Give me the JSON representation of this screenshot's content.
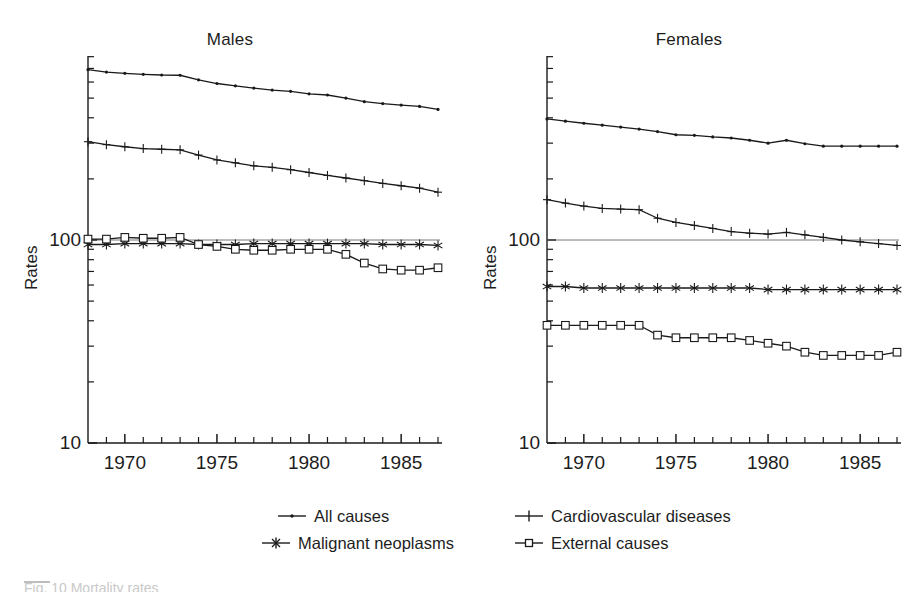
{
  "figure": {
    "caption_partial": "Fig. 10  Mortality rates",
    "background": "#ffffff",
    "line_color": "#1a1a1a"
  },
  "panels": [
    {
      "id": "males",
      "title": "Males",
      "ylabel": "Rates"
    },
    {
      "id": "females",
      "title": "Females",
      "ylabel": "Rates"
    }
  ],
  "legend": {
    "position": "bottom-center",
    "items": [
      {
        "label": "All causes",
        "marker": "dot",
        "color": "#1a1a1a"
      },
      {
        "label": "Cardiovascular diseases",
        "marker": "plus",
        "color": "#1a1a1a"
      },
      {
        "label": "Malignant neoplasms",
        "marker": "asterisk",
        "color": "#1a1a1a"
      },
      {
        "label": "External causes",
        "marker": "square",
        "color": "#1a1a1a"
      }
    ]
  },
  "axes": {
    "y_tick_labels": [
      "100",
      "10"
    ],
    "y_scale": "log",
    "ylim": [
      10,
      1000
    ],
    "x_tick_labels": [
      "1970",
      "1975",
      "1980",
      "1985"
    ],
    "x_tick_values": [
      1970,
      1975,
      1980,
      1985
    ],
    "xlim": [
      1968,
      1987
    ],
    "grid": false
  },
  "chart_data": {
    "type": "line",
    "xlabel": "",
    "ylabel": "Rates",
    "ylim": [
      10,
      1000
    ],
    "xlim": [
      1968,
      1987
    ],
    "yscale": "log",
    "grid": false,
    "legend_position": "bottom-center",
    "x": [
      1968,
      1969,
      1970,
      1971,
      1972,
      1973,
      1974,
      1975,
      1976,
      1977,
      1978,
      1979,
      1980,
      1981,
      1982,
      1983,
      1984,
      1985,
      1986,
      1987
    ],
    "panels": [
      {
        "name": "Males",
        "series": [
          {
            "name": "All causes",
            "marker": "dot",
            "values": [
              690,
              672,
              662,
              655,
              650,
              648,
              615,
              590,
              575,
              560,
              548,
              540,
              525,
              518,
              500,
              480,
              470,
              462,
              455,
              440
            ]
          },
          {
            "name": "Cardiovascular diseases",
            "marker": "plus",
            "values": [
              305,
              295,
              288,
              282,
              280,
              278,
              262,
              248,
              240,
              232,
              228,
              222,
              215,
              208,
              202,
              196,
              190,
              185,
              180,
              172
            ]
          },
          {
            "name": "Malignant neoplasms",
            "marker": "asterisk",
            "values": [
              95,
              95,
              96,
              96,
              96,
              96,
              95,
              95,
              95,
              96,
              96,
              96,
              96,
              96,
              96,
              96,
              95,
              95,
              95,
              94
            ]
          },
          {
            "name": "External causes",
            "marker": "square",
            "values": [
              101,
              101,
              103,
              102,
              102,
              103,
              95,
              93,
              90,
              89,
              89,
              90,
              90,
              90,
              85,
              77,
              72,
              71,
              71,
              73,
              69
            ]
          }
        ]
      },
      {
        "name": "Females",
        "series": [
          {
            "name": "All causes",
            "marker": "dot",
            "values": [
              395,
              385,
              376,
              368,
              360,
              352,
              342,
              330,
              328,
              322,
              318,
              310,
              300,
              310,
              298,
              290,
              290,
              290,
              290,
              290
            ]
          },
          {
            "name": "Cardiovascular diseases",
            "marker": "plus",
            "values": [
              158,
              152,
              147,
              143,
              142,
              141,
              128,
              122,
              118,
              114,
              110,
              108,
              107,
              109,
              106,
              103,
              100,
              98,
              96,
              94
            ]
          },
          {
            "name": "Malignant neoplasms",
            "marker": "asterisk",
            "values": [
              59,
              59,
              58,
              58,
              58,
              58,
              58,
              58,
              58,
              58,
              58,
              58,
              57,
              57,
              57,
              57,
              57,
              57,
              57,
              57
            ]
          },
          {
            "name": "External causes",
            "marker": "square",
            "values": [
              38,
              38,
              38,
              38,
              38,
              38,
              34,
              33,
              33,
              33,
              33,
              32,
              31,
              30,
              28,
              27,
              27,
              27,
              27,
              28
            ]
          }
        ]
      }
    ]
  }
}
